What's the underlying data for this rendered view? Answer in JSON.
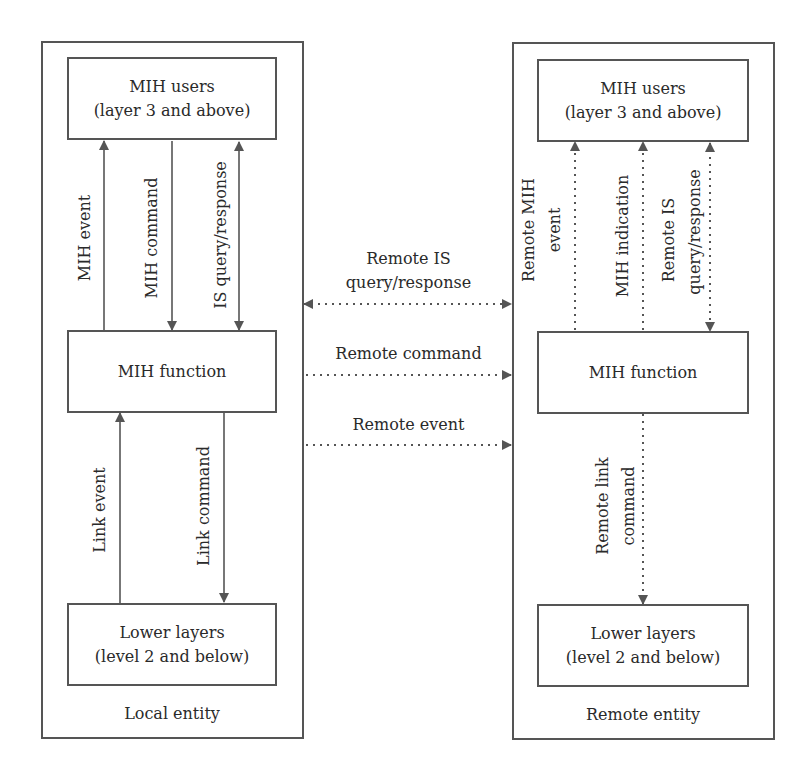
{
  "local": {
    "caption": "Local entity",
    "users": {
      "line1": "MIH users",
      "line2": "(layer 3 and above)"
    },
    "function": {
      "label": "MIH function"
    },
    "lower": {
      "line1": "Lower layers",
      "line2": "(level 2 and below)"
    },
    "arrows": {
      "mih_event": "MIH event",
      "mih_command": "MIH command",
      "is_query": "IS query/response",
      "link_event": "Link event",
      "link_command": "Link command"
    }
  },
  "remote": {
    "caption": "Remote entity",
    "users": {
      "line1": "MIH users",
      "line2": "(layer 3 and above)"
    },
    "function": {
      "label": "MIH function"
    },
    "lower": {
      "line1": "Lower layers",
      "line2": "(level 2 and below)"
    },
    "arrows": {
      "remote_mih_event_1": "Remote MIH",
      "remote_mih_event_2": "event",
      "mih_indication": "MIH indication",
      "remote_is_1": "Remote IS",
      "remote_is_2": "query/response",
      "remote_link_command_1": "Remote link",
      "remote_link_command_2": "command"
    }
  },
  "between": {
    "remote_is_1": "Remote IS",
    "remote_is_2": "query/response",
    "remote_command": "Remote command",
    "remote_event": "Remote event"
  },
  "colors": {
    "line": "#555555",
    "text": "#2a2a2a"
  }
}
